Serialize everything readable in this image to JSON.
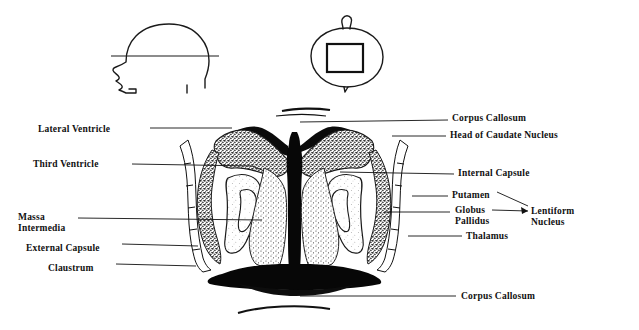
{
  "figure": {
    "background_color": "#ffffff",
    "ink_color": "#111111"
  },
  "orientation_sketches": [
    {
      "name": "lateral-head-profile",
      "description": "Side view of head with horizontal section plane line"
    },
    {
      "name": "axial-head-outline",
      "description": "Top-down head outline with rectangular field-of-view box"
    }
  ],
  "labels_left": [
    {
      "text": "Lateral Ventricle",
      "x": 38,
      "y": 124,
      "leader_to_x": 228,
      "leader_to_y": 129
    },
    {
      "text": "Third Ventricle",
      "x": 33,
      "y": 159,
      "leader_to_x": 250,
      "leader_to_y": 166
    },
    {
      "text": "Massa",
      "text2": "Intermedia",
      "x": 18,
      "y": 212,
      "leader_to_x": 215,
      "leader_to_y": 219
    },
    {
      "text": "External Capsule",
      "x": 26,
      "y": 243,
      "leader_to_x": 195,
      "leader_to_y": 246
    },
    {
      "text": "Claustrum",
      "x": 48,
      "y": 264,
      "leader_to_x": 193,
      "leader_to_y": 265
    }
  ],
  "labels_right": [
    {
      "text": "Corpus Callosum",
      "x": 452,
      "y": 114,
      "leader_from_x": 300,
      "leader_from_y": 123
    },
    {
      "text": "Head of Caudate Nucleus",
      "x": 450,
      "y": 131,
      "leader_from_x": 390,
      "leader_from_y": 136
    },
    {
      "text": "Internal Capsule",
      "x": 458,
      "y": 170,
      "leader_from_x": 340,
      "leader_from_y": 172
    },
    {
      "text": "Putamen",
      "x": 452,
      "y": 192,
      "leader_from_x": 408,
      "leader_from_y": 195
    },
    {
      "text": "Globus",
      "text2": "Pallidus",
      "x": 455,
      "y": 205,
      "leader_from_x": 383,
      "leader_from_y": 212
    },
    {
      "text": "Thalamus",
      "x": 466,
      "y": 233,
      "leader_from_x": 405,
      "leader_from_y": 236
    },
    {
      "text": "Lentiform",
      "text2": "Nucleus",
      "x": 533,
      "y": 207
    },
    {
      "text": "Corpus Callosum",
      "x": 461,
      "y": 293,
      "leader_from_x": 300,
      "leader_from_y": 296
    }
  ],
  "structures": [
    "Corpus Callosum",
    "Head of Caudate Nucleus",
    "Lateral Ventricle",
    "Third Ventricle",
    "Massa Intermedia",
    "Internal Capsule",
    "Putamen",
    "Globus Pallidus",
    "Lentiform Nucleus",
    "Thalamus",
    "External Capsule",
    "Claustrum"
  ]
}
